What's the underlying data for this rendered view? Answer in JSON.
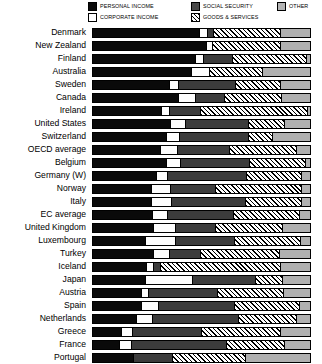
{
  "legend": {
    "items": [
      {
        "key": "personal",
        "label": "PERSONAL INCOME",
        "swatch": "sw-personal",
        "color": "#0a0a0a"
      },
      {
        "key": "social",
        "label": "SOCIAL SECURITY",
        "swatch": "sw-social",
        "color": "#4a4a4a"
      },
      {
        "key": "other",
        "label": "OTHER",
        "swatch": "sw-other",
        "color": "#b4b4b4"
      },
      {
        "key": "corporate",
        "label": "CORPORATE INCOME",
        "swatch": "sw-corporate",
        "color": "#ffffff"
      },
      {
        "key": "goods",
        "label": "GOODS & SERVICES",
        "swatch": "sw-goods",
        "color": "#ffffff"
      }
    ]
  },
  "chart_data": {
    "type": "bar",
    "orientation": "horizontal",
    "stacked": true,
    "normalized": true,
    "title": "",
    "xlabel": "",
    "ylabel": "",
    "xlim": [
      0,
      100
    ],
    "grid": false,
    "legend_position": "top",
    "series": [
      {
        "name": "PERSONAL INCOME",
        "key": "personal",
        "color": "#0a0a0a",
        "pattern": "solid-black"
      },
      {
        "name": "CORPORATE INCOME",
        "key": "corporate",
        "color": "#ffffff",
        "pattern": "solid-white"
      },
      {
        "name": "SOCIAL SECURITY",
        "key": "social",
        "color": "#3c3c3c",
        "pattern": "solid-dark-gray"
      },
      {
        "name": "GOODS & SERVICES",
        "key": "goods",
        "color": "#ffffff",
        "pattern": "diagonal-hatch"
      },
      {
        "name": "OTHER",
        "key": "other",
        "color": "#b0b0b0",
        "pattern": "solid-light-gray"
      }
    ],
    "categories": [
      "Denmark",
      "New Zealand",
      "Finland",
      "Australia",
      "Sweden",
      "Canada",
      "Ireland",
      "United States",
      "Switzerland",
      "Belgium",
      "OECD average",
      "Germany (W)",
      "Norway",
      "Italy",
      "EC average",
      "United Kingdom",
      "Luxembourg",
      "Turkey",
      "Iceland",
      "Japan",
      "Austria",
      "Spain",
      "Netherlands",
      "Greece",
      "France",
      "Portugal"
    ],
    "rows": [
      {
        "category": "Denmark",
        "personal": 49.0,
        "corporate": 3.5,
        "social": 3.0,
        "goods": 30.5,
        "other": 14.0
      },
      {
        "category": "New Zealand",
        "personal": 52.0,
        "corporate": 3.0,
        "social": 0.0,
        "goods": 31.0,
        "other": 14.0
      },
      {
        "category": "Finland",
        "personal": 47.0,
        "corporate": 3.5,
        "social": 13.5,
        "goods": 34.0,
        "other": 2.0
      },
      {
        "category": "Australia",
        "personal": 45.0,
        "corporate": 8.5,
        "social": 0.0,
        "goods": 24.5,
        "other": 22.0
      },
      {
        "category": "Sweden",
        "personal": 35.0,
        "corporate": 4.0,
        "social": 26.5,
        "goods": 20.5,
        "other": 14.0
      },
      {
        "category": "Canada",
        "personal": 39.0,
        "corporate": 8.0,
        "social": 13.5,
        "goods": 26.0,
        "other": 13.5
      },
      {
        "category": "Ireland",
        "personal": 31.5,
        "corporate": 3.5,
        "social": 14.5,
        "goods": 49.0,
        "other": 1.5
      },
      {
        "category": "United States",
        "personal": 35.5,
        "corporate": 7.0,
        "social": 29.0,
        "goods": 16.5,
        "other": 12.0
      },
      {
        "category": "Switzerland",
        "personal": 33.5,
        "corporate": 6.0,
        "social": 32.0,
        "goods": 11.0,
        "other": 17.5
      },
      {
        "category": "OECD average",
        "personal": 31.0,
        "corporate": 7.5,
        "social": 24.0,
        "goods": 31.0,
        "other": 6.5
      },
      {
        "category": "Belgium",
        "personal": 33.5,
        "corporate": 6.5,
        "social": 32.0,
        "goods": 25.5,
        "other": 2.5
      },
      {
        "category": "Germany (W)",
        "personal": 29.0,
        "corporate": 5.0,
        "social": 36.5,
        "goods": 25.5,
        "other": 4.0
      },
      {
        "category": "Norway",
        "personal": 26.5,
        "corporate": 9.0,
        "social": 20.5,
        "goods": 40.0,
        "other": 4.0
      },
      {
        "category": "Italy",
        "personal": 26.5,
        "corporate": 9.5,
        "social": 34.0,
        "goods": 26.0,
        "other": 4.0
      },
      {
        "category": "EC average",
        "personal": 27.0,
        "corporate": 7.0,
        "social": 30.5,
        "goods": 30.5,
        "other": 5.0
      },
      {
        "category": "United Kingdom",
        "personal": 27.5,
        "corporate": 10.5,
        "social": 18.0,
        "goods": 31.0,
        "other": 13.0
      },
      {
        "category": "Luxembourg",
        "personal": 24.0,
        "corporate": 14.0,
        "social": 27.0,
        "goods": 30.5,
        "other": 4.5
      },
      {
        "category": "Turkey",
        "personal": 27.5,
        "corporate": 7.5,
        "social": 14.5,
        "goods": 36.0,
        "other": 14.5
      },
      {
        "category": "Iceland",
        "personal": 24.5,
        "corporate": 3.0,
        "social": 3.5,
        "goods": 55.0,
        "other": 14.0
      },
      {
        "category": "Japan",
        "personal": 24.0,
        "corporate": 21.5,
        "social": 29.0,
        "goods": 12.5,
        "other": 13.0
      },
      {
        "category": "Austria",
        "personal": 22.0,
        "corporate": 3.5,
        "social": 31.5,
        "goods": 30.5,
        "other": 12.5
      },
      {
        "category": "Spain",
        "personal": 22.0,
        "corporate": 8.0,
        "social": 35.0,
        "goods": 30.0,
        "other": 5.0
      },
      {
        "category": "Netherlands",
        "personal": 20.0,
        "corporate": 7.0,
        "social": 40.0,
        "goods": 26.5,
        "other": 6.5
      },
      {
        "category": "Greece",
        "personal": 13.0,
        "corporate": 5.0,
        "social": 32.0,
        "goods": 36.0,
        "other": 14.0
      },
      {
        "category": "France",
        "personal": 12.0,
        "corporate": 5.5,
        "social": 44.0,
        "goods": 26.5,
        "other": 12.0
      },
      {
        "category": "Portugal",
        "personal": 18.5,
        "corporate": 0.0,
        "social": 18.0,
        "goods": 33.5,
        "other": 30.0
      }
    ]
  }
}
